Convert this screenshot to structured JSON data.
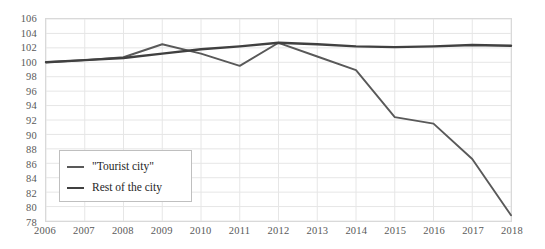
{
  "chart_data": {
    "type": "line",
    "title": "",
    "xlabel": "",
    "ylabel": "",
    "x": [
      2006,
      2007,
      2008,
      2009,
      2010,
      2011,
      2012,
      2013,
      2014,
      2015,
      2016,
      2017,
      2018
    ],
    "x_tick_labels": [
      "2006",
      "2007",
      "2008",
      "2009",
      "2010",
      "2011",
      "2012",
      "2013",
      "2014",
      "2015",
      "2016",
      "2017",
      "2018"
    ],
    "y_tick_labels": [
      "106",
      "104",
      "102",
      "100",
      "98",
      "96",
      "94",
      "92",
      "90",
      "88",
      "86",
      "84",
      "82",
      "80",
      "78"
    ],
    "y_ticks": [
      106,
      104,
      102,
      100,
      98,
      96,
      94,
      92,
      90,
      88,
      86,
      84,
      82,
      80,
      78
    ],
    "ylim": [
      78,
      106
    ],
    "xlim": [
      2006,
      2018
    ],
    "grid": true,
    "grid_color": "#e6e6e6",
    "legend_position": "inside-lower-left",
    "series": [
      {
        "name": "\"Tourist city\"",
        "color": "#595959",
        "width": 1.9,
        "values": [
          100.0,
          100.3,
          100.7,
          102.5,
          101.2,
          99.5,
          102.7,
          100.8,
          98.9,
          92.4,
          91.5,
          86.6,
          78.8
        ]
      },
      {
        "name": "Rest of the city",
        "color": "#404040",
        "width": 2.4,
        "values": [
          100.0,
          100.3,
          100.6,
          101.2,
          101.8,
          102.2,
          102.7,
          102.5,
          102.2,
          102.1,
          102.2,
          102.4,
          102.3
        ]
      }
    ]
  },
  "legend": {
    "entries": [
      {
        "label": "\"Tourist city\""
      },
      {
        "label": "Rest of the city"
      }
    ]
  }
}
